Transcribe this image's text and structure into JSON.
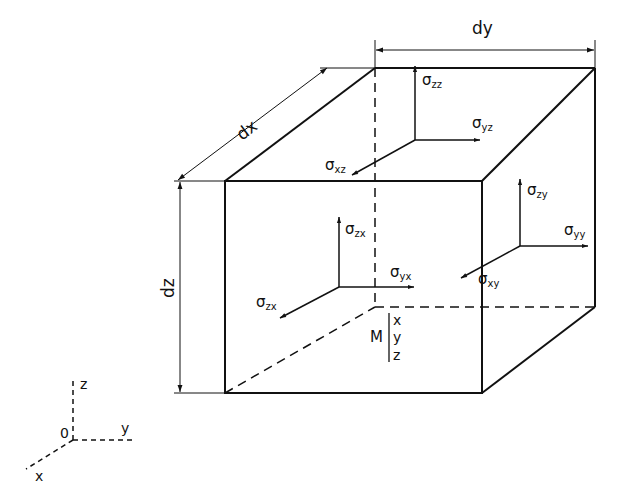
{
  "figure": {
    "type": "stress element cube diagram",
    "dimensions": {
      "dx": "dx",
      "dy": "dy",
      "dz": "dz"
    },
    "point_label": {
      "name": "M",
      "coords": [
        "x",
        "y",
        "z"
      ]
    },
    "axes": {
      "origin": "0",
      "x": "x",
      "y": "y",
      "z": "z"
    },
    "stress_groups": {
      "top_face": [
        {
          "sym": "σ",
          "sub": "zz"
        },
        {
          "sym": "σ",
          "sub": "yz"
        },
        {
          "sym": "σ",
          "sub": "xz"
        }
      ],
      "front_face": [
        {
          "sym": "σ",
          "sub": "zx"
        },
        {
          "sym": "σ",
          "sub": "yx"
        },
        {
          "sym": "σ",
          "sub": "zx"
        }
      ],
      "right_face": [
        {
          "sym": "σ",
          "sub": "zy"
        },
        {
          "sym": "σ",
          "sub": "yy"
        },
        {
          "sym": "σ",
          "sub": "xy"
        }
      ]
    },
    "colors": {
      "line": "#111111",
      "background": "#ffffff"
    }
  }
}
